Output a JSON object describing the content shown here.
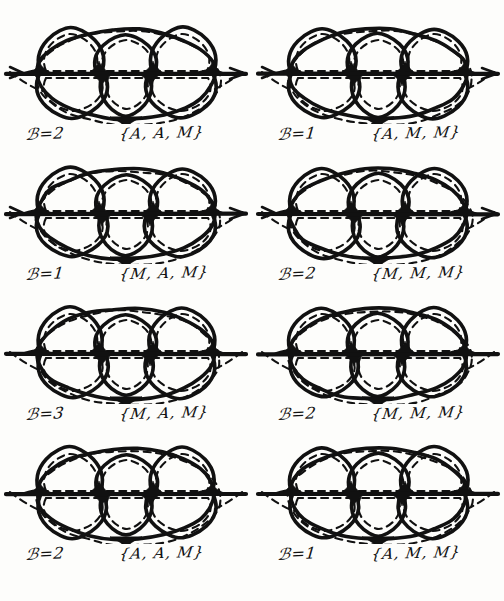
{
  "page": {
    "background_color": "#fdfdfb",
    "ink_color": "#111111",
    "width": 504,
    "height": 601,
    "columns": 2,
    "rows": 4
  },
  "figures": [
    {
      "id": "fig-1",
      "row": 1,
      "col": 1,
      "b_label": "ℬ=2",
      "set_label": "{A, A, M}",
      "b_value": 2,
      "multiset": [
        "A",
        "A",
        "M"
      ],
      "axis_arrow_left": true,
      "axis_arrow_right": true
    },
    {
      "id": "fig-2",
      "row": 1,
      "col": 2,
      "b_label": "ℬ=1",
      "set_label": "{A, M, M}",
      "b_value": 1,
      "multiset": [
        "A",
        "M",
        "M"
      ],
      "axis_arrow_left": true,
      "axis_arrow_right": true
    },
    {
      "id": "fig-3",
      "row": 2,
      "col": 1,
      "b_label": "ℬ=1",
      "set_label": "{M, A, M}",
      "b_value": 1,
      "multiset": [
        "M",
        "A",
        "M"
      ],
      "axis_arrow_left": true,
      "axis_arrow_right": true
    },
    {
      "id": "fig-4",
      "row": 2,
      "col": 2,
      "b_label": "ℬ=2",
      "set_label": "{M, M, M}",
      "b_value": 2,
      "multiset": [
        "M",
        "M",
        "M"
      ],
      "axis_arrow_left": true,
      "axis_arrow_right": true
    },
    {
      "id": "fig-5",
      "row": 3,
      "col": 1,
      "b_label": "ℬ=3",
      "set_label": "{M, A, M}",
      "b_value": 3,
      "multiset": [
        "M",
        "A",
        "M"
      ],
      "axis_arrow_left": false,
      "axis_arrow_right": false
    },
    {
      "id": "fig-6",
      "row": 3,
      "col": 2,
      "b_label": "ℬ=2",
      "set_label": "{M, M, M}",
      "b_value": 2,
      "multiset": [
        "M",
        "M",
        "M"
      ],
      "axis_arrow_left": false,
      "axis_arrow_right": false
    },
    {
      "id": "fig-7",
      "row": 4,
      "col": 1,
      "b_label": "ℬ=2",
      "set_label": "{A, A, M}",
      "b_value": 2,
      "multiset": [
        "A",
        "A",
        "M"
      ],
      "axis_arrow_left": false,
      "axis_arrow_right": false
    },
    {
      "id": "fig-8",
      "row": 4,
      "col": 2,
      "b_label": "ℬ=1",
      "set_label": "{A, M, M}",
      "b_value": 1,
      "multiset": [
        "A",
        "M",
        "M"
      ],
      "axis_arrow_left": false,
      "axis_arrow_right": false
    }
  ]
}
